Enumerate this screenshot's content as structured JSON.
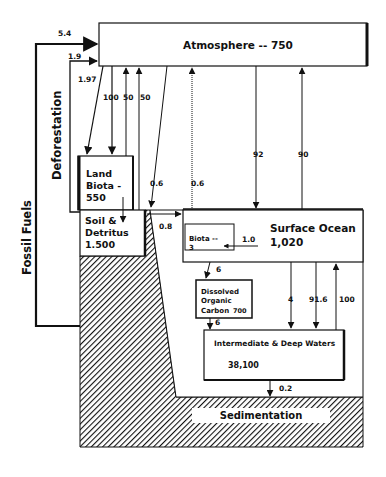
{
  "diagram": {
    "reservoirs": {
      "atmosphere": "Atmosphere -- 750",
      "land_biota": [
        "Land",
        "Biota -",
        "550"
      ],
      "soil_detritus": [
        "Soil &",
        "Detritus",
        "1.500"
      ],
      "surface_ocean": [
        "Surface Ocean",
        "1,020"
      ],
      "marine_biota": [
        "Biota --",
        "3"
      ],
      "doc": [
        "Dissolved",
        "Organic",
        "Carbon"
      ],
      "doc_value": "700",
      "deep_waters": "Intermediate & Deep Waters",
      "deep_waters_value": "38,100",
      "sedimentation": "Sedimentation"
    },
    "side_labels": {
      "fossil_fuels": "Fossil Fuels",
      "deforestation": "Deforestation"
    },
    "fluxes": {
      "fossil_fuels": "5.4",
      "deforestation": "1.9",
      "atm_to_land": "1.97",
      "photosynthesis": "100",
      "land_resp_1": "50",
      "land_resp_2": "50",
      "runoff_diag": "0.6",
      "runoff_vert": "0.6",
      "soil_to_ocean": "0.8",
      "atm_to_ocean": "92",
      "ocean_to_atm": "90",
      "ocean_to_biota": "1.0",
      "to_doc": "6",
      "doc_to_deep": "6",
      "downwelling_1": "4",
      "downwelling_2": "91.6",
      "upwelling": "100",
      "sedimentation": "0.2"
    },
    "colors": {
      "line": "#111111",
      "background": "#ffffff"
    }
  }
}
